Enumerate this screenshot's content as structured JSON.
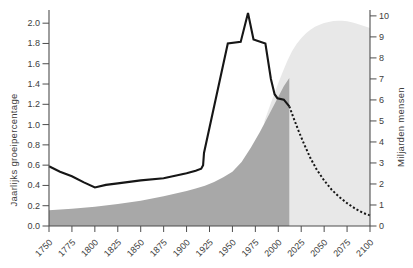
{
  "chart_data": {
    "type": "area",
    "title": "",
    "x_axis": {
      "range": [
        1750,
        2100
      ],
      "tick_labels": [
        "1750",
        "1775",
        "1800",
        "1825",
        "1850",
        "1875",
        "1900",
        "1925",
        "1950",
        "1975",
        "2000",
        "2025",
        "2050",
        "2075",
        "2100"
      ]
    },
    "y_left": {
      "label": "Jaarlijks groeipercentage",
      "range": [
        0,
        2.13
      ],
      "tick_labels": [
        "0.0",
        "0.2",
        "0.4",
        "0.6",
        "0.8",
        "1.0",
        "1.2",
        "1.4",
        "1.6",
        "1.8",
        "2.0"
      ]
    },
    "y_right": {
      "label": "Miljarden mensen",
      "range": [
        0,
        10.28
      ],
      "tick_labels": [
        "0",
        "1",
        "2",
        "3",
        "4",
        "5",
        "6",
        "7",
        "8",
        "9",
        "10"
      ]
    },
    "colors": {
      "history_area": "#a8a8a8",
      "projection_area": "#e8e8e8",
      "line": "#161616",
      "axis": "#4d4d4d"
    },
    "series": [
      {
        "name": "world-population-projection",
        "kind": "area",
        "axis": "right",
        "color_key": "projection_area",
        "points": [
          [
            1985,
            5.0
          ],
          [
            1990,
            5.62
          ],
          [
            1995,
            6.22
          ],
          [
            2000,
            6.8
          ],
          [
            2005,
            7.36
          ],
          [
            2010,
            7.88
          ],
          [
            2015,
            8.32
          ],
          [
            2020,
            8.66
          ],
          [
            2025,
            8.94
          ],
          [
            2030,
            9.16
          ],
          [
            2035,
            9.34
          ],
          [
            2040,
            9.48
          ],
          [
            2045,
            9.58
          ],
          [
            2050,
            9.66
          ],
          [
            2055,
            9.71
          ],
          [
            2060,
            9.75
          ],
          [
            2065,
            9.77
          ],
          [
            2070,
            9.77
          ],
          [
            2075,
            9.74
          ],
          [
            2080,
            9.7
          ],
          [
            2085,
            9.64
          ],
          [
            2090,
            9.57
          ],
          [
            2095,
            9.5
          ],
          [
            2100,
            9.42
          ]
        ]
      },
      {
        "name": "world-population-history",
        "kind": "area",
        "axis": "right",
        "color_key": "history_area",
        "points": [
          [
            1750,
            0.75
          ],
          [
            1775,
            0.82
          ],
          [
            1800,
            0.92
          ],
          [
            1825,
            1.04
          ],
          [
            1850,
            1.2
          ],
          [
            1875,
            1.42
          ],
          [
            1900,
            1.66
          ],
          [
            1910,
            1.78
          ],
          [
            1920,
            1.92
          ],
          [
            1930,
            2.1
          ],
          [
            1940,
            2.32
          ],
          [
            1950,
            2.58
          ],
          [
            1960,
            3.05
          ],
          [
            1970,
            3.72
          ],
          [
            1980,
            4.48
          ],
          [
            1990,
            5.3
          ],
          [
            2000,
            6.15
          ],
          [
            2006,
            6.65
          ],
          [
            2012,
            7.05
          ]
        ]
      },
      {
        "name": "growth-rate-history",
        "kind": "line",
        "axis": "left",
        "color_key": "line",
        "width": 2.1,
        "points": [
          [
            1750,
            0.59
          ],
          [
            1762,
            0.535
          ],
          [
            1775,
            0.49
          ],
          [
            1788,
            0.43
          ],
          [
            1800,
            0.38
          ],
          [
            1812,
            0.405
          ],
          [
            1825,
            0.42
          ],
          [
            1850,
            0.45
          ],
          [
            1875,
            0.47
          ],
          [
            1890,
            0.5
          ],
          [
            1900,
            0.52
          ],
          [
            1910,
            0.545
          ],
          [
            1916,
            0.565
          ],
          [
            1918,
            0.6
          ],
          [
            1919,
            0.72
          ],
          [
            1945,
            1.8
          ],
          [
            1959,
            1.815
          ],
          [
            1967,
            2.1
          ],
          [
            1973,
            1.84
          ],
          [
            1986,
            1.8
          ],
          [
            1992,
            1.45
          ],
          [
            1996,
            1.3
          ],
          [
            1999,
            1.26
          ],
          [
            2006,
            1.245
          ],
          [
            2012,
            1.18
          ]
        ]
      },
      {
        "name": "growth-rate-projection",
        "kind": "line",
        "axis": "left",
        "color_key": "line",
        "width": 2,
        "dash": "2.1,2.1",
        "points": [
          [
            2012,
            1.18
          ],
          [
            2016,
            1.08
          ],
          [
            2022,
            0.94
          ],
          [
            2028,
            0.81
          ],
          [
            2035,
            0.67
          ],
          [
            2042,
            0.555
          ],
          [
            2050,
            0.45
          ],
          [
            2058,
            0.36
          ],
          [
            2066,
            0.29
          ],
          [
            2075,
            0.225
          ],
          [
            2085,
            0.165
          ],
          [
            2092,
            0.13
          ],
          [
            2100,
            0.105
          ]
        ]
      }
    ]
  }
}
